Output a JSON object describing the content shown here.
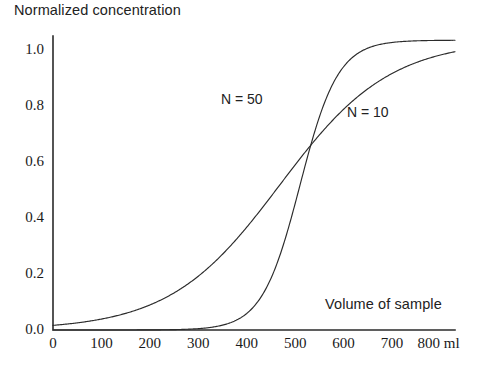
{
  "chart_data": {
    "type": "line",
    "title": "",
    "ylabel": "Normalized concentration",
    "xlabel": "Volume of sample",
    "xunit": "ml",
    "xlim": [
      0,
      830
    ],
    "ylim": [
      0.0,
      1.05
    ],
    "xticks": [
      0,
      100,
      200,
      300,
      400,
      500,
      600,
      700,
      800
    ],
    "xtick_labels": [
      "0",
      "100",
      "200",
      "300",
      "400",
      "500",
      "600",
      "700",
      "800 ml"
    ],
    "yticks": [
      0.0,
      0.2,
      0.4,
      0.6,
      0.8,
      1.0
    ],
    "ytick_labels": [
      "0.0",
      "0.2",
      "0.4",
      "0.6",
      "0.8",
      "1.0"
    ],
    "grid": false,
    "legend_position": "inline-annotations",
    "axis_color": "#2b2b2b",
    "curve_color": "#2b2b2b",
    "series": [
      {
        "name": "N = 50",
        "label": "N = 50",
        "label_x": 300,
        "label_y": 0.8,
        "midpoint": 510,
        "steepness": 0.0255,
        "amplitude": 1.035,
        "x": [
          0,
          50,
          100,
          150,
          200,
          250,
          300,
          350,
          400,
          420,
          440,
          460,
          480,
          500,
          510,
          520,
          540,
          560,
          580,
          600,
          650,
          700,
          750,
          800,
          830
        ],
        "values": [
          0.0,
          0.0,
          0.0,
          0.01,
          0.01,
          0.02,
          0.03,
          0.06,
          0.12,
          0.16,
          0.22,
          0.31,
          0.41,
          0.52,
          0.57,
          0.63,
          0.73,
          0.82,
          0.88,
          0.93,
          0.99,
          1.02,
          1.03,
          1.03,
          1.04
        ]
      },
      {
        "name": "N = 10",
        "label": "N = 10",
        "label_x": 640,
        "label_y": 0.73,
        "midpoint": 468,
        "steepness": 0.0088,
        "amplitude": 1.035,
        "x": [
          0,
          50,
          100,
          150,
          200,
          250,
          300,
          350,
          400,
          450,
          500,
          550,
          600,
          650,
          700,
          750,
          800,
          830
        ],
        "values": [
          0.02,
          0.03,
          0.05,
          0.07,
          0.11,
          0.16,
          0.23,
          0.31,
          0.4,
          0.49,
          0.58,
          0.67,
          0.76,
          0.84,
          0.91,
          0.96,
          1.0,
          1.02
        ]
      }
    ]
  },
  "plot_geometry": {
    "left": 53,
    "right": 455,
    "top": 36,
    "bottom": 330
  }
}
